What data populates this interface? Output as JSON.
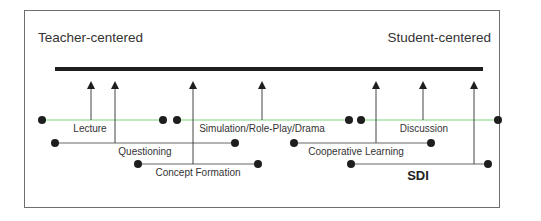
{
  "title_left": "Teacher-centered",
  "title_right": "Student-centered",
  "colors": {
    "axis": "#1e1e1e",
    "arrow": "#444444",
    "row1_line": "#7fd27f",
    "row_line": "#666666",
    "dot": "#1e1e1e",
    "text": "#333333",
    "frame": "#6e6e6e"
  },
  "continuum": {
    "x1": 55,
    "x2": 483,
    "y": 69
  },
  "methods": [
    {
      "label": "Lecture",
      "x1": 42,
      "x2": 163,
      "y": 120,
      "arrow_x": 91,
      "label_x": 90,
      "row": 1,
      "bold": false
    },
    {
      "label": "Simulation/Role-Play/Drama",
      "x1": 177,
      "x2": 349,
      "y": 120,
      "arrow_x": 262,
      "label_x": 262,
      "row": 1,
      "bold": false
    },
    {
      "label": "Discussion",
      "x1": 361,
      "x2": 498,
      "y": 120,
      "arrow_x": 423,
      "label_x": 424,
      "row": 1,
      "bold": false
    },
    {
      "label": "Questioning",
      "x1": 55,
      "x2": 235,
      "y": 143,
      "arrow_x": 115,
      "label_x": 145,
      "row": 2,
      "bold": false
    },
    {
      "label": "Cooperative Learning",
      "x1": 294,
      "x2": 431,
      "y": 143,
      "arrow_x": 376,
      "label_x": 356,
      "row": 2,
      "bold": false
    },
    {
      "label": "Concept Formation",
      "x1": 138,
      "x2": 258,
      "y": 164,
      "arrow_x": 193,
      "label_x": 198,
      "row": 3,
      "bold": false
    },
    {
      "label": "SDI",
      "x1": 351,
      "x2": 488,
      "y": 164,
      "arrow_x": 474,
      "label_x": 418,
      "row": 3,
      "bold": true
    }
  ],
  "arrow_tip_y": 81
}
